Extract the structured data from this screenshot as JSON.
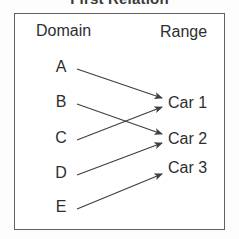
{
  "title": "First Relation",
  "diagram": {
    "domain_header": "Domain",
    "range_header": "Range",
    "domain_items": [
      "A",
      "B",
      "C",
      "D",
      "E"
    ],
    "range_items": [
      "Car 1",
      "Car 2",
      "Car 3"
    ],
    "mappings": [
      {
        "from": "A",
        "to": "Car 1"
      },
      {
        "from": "B",
        "to": "Car 2"
      },
      {
        "from": "C",
        "to": "Car 1"
      },
      {
        "from": "D",
        "to": "Car 2"
      },
      {
        "from": "E",
        "to": "Car 3"
      }
    ],
    "colors": {
      "line": "#3f3f3f",
      "border": "#606060",
      "text": "#2e2e2e",
      "background": "#ffffff"
    }
  }
}
